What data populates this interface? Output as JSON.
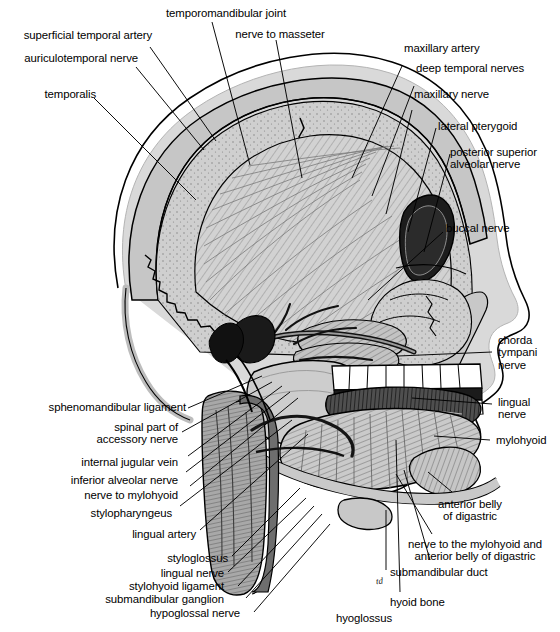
{
  "figure": {
    "artist_mark": "td"
  },
  "colors": {
    "bone_light": "#d5d5d5",
    "bone_mid": "#bcbcbc",
    "bone_dark": "#9a9a9a",
    "muscle_dark": "#6f6f6f",
    "outline": "#000000",
    "soft_tissue": "#c9c9c9",
    "background": "#ffffff",
    "teeth": "#ffffff"
  },
  "labels": {
    "top_left": [
      {
        "id": "superficial-temporal-artery",
        "text": "superficial temporal artery"
      },
      {
        "id": "auriculotemporal-nerve",
        "text": "auriculotemporal nerve"
      },
      {
        "id": "temporalis",
        "text": "temporalis"
      }
    ],
    "top_center": [
      {
        "id": "temporomandibular-joint",
        "text": "temporomandibular joint"
      },
      {
        "id": "nerve-to-masseter",
        "text": "nerve to masseter"
      }
    ],
    "top_right": [
      {
        "id": "maxillary-artery",
        "text": "maxillary artery"
      },
      {
        "id": "deep-temporal-nerves",
        "text": "deep temporal nerves"
      },
      {
        "id": "maxillary-nerve",
        "text": "maxillary nerve"
      },
      {
        "id": "lateral-pterygoid",
        "text": "lateral pterygoid"
      },
      {
        "id": "posterior-superior-alveolar-nerve",
        "text": "posterior superior\nalveolar nerve"
      },
      {
        "id": "buccal-nerve",
        "text": "buccal nerve"
      }
    ],
    "middle_right": [
      {
        "id": "chorda-tympani-nerve",
        "text": "chorda\ntympani\nnerve"
      },
      {
        "id": "lingual-nerve-right",
        "text": "lingual\nnerve"
      },
      {
        "id": "mylohyoid",
        "text": "mylohyoid"
      }
    ],
    "bottom_right": [
      {
        "id": "anterior-belly-of-digastric",
        "text": "anterior belly\nof digastric"
      },
      {
        "id": "nerve-to-mylohyoid-and-anterior-belly-of-digastric",
        "text": "nerve to the mylohyoid and\nanterior belly of digastric"
      },
      {
        "id": "submandibular-duct",
        "text": "submandibular duct"
      }
    ],
    "bottom_center": [
      {
        "id": "hyoid-bone",
        "text": "hyoid bone"
      },
      {
        "id": "hyoglossus",
        "text": "hyoglossus"
      }
    ],
    "left": [
      {
        "id": "sphenomandibular-ligament",
        "text": "sphenomandibular ligament"
      },
      {
        "id": "spinal-part-of-accessory-nerve",
        "text": "spinal part of\naccessory nerve"
      },
      {
        "id": "internal-jugular-vein",
        "text": "internal jugular vein"
      },
      {
        "id": "inferior-alveolar-nerve",
        "text": "inferior alveolar nerve"
      },
      {
        "id": "nerve-to-mylohyoid",
        "text": "nerve to mylohyoid"
      },
      {
        "id": "stylopharyngeus",
        "text": "stylopharyngeus"
      },
      {
        "id": "lingual-artery",
        "text": "lingual artery"
      }
    ],
    "bottom_left": [
      {
        "id": "styloglossus",
        "text": "styloglossus"
      },
      {
        "id": "lingual-nerve-left",
        "text": "lingual nerve"
      },
      {
        "id": "stylohyoid-ligament",
        "text": "stylohyoid ligament"
      },
      {
        "id": "submandibular-ganglion",
        "text": "submandibular ganglion"
      },
      {
        "id": "hypoglossal-nerve",
        "text": "hypoglossal nerve"
      }
    ]
  }
}
